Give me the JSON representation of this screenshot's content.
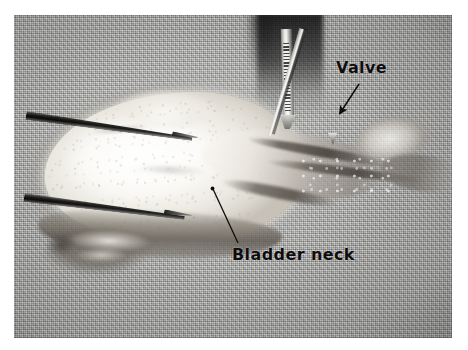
{
  "figure": {
    "kind": "surgical-specimen-photograph",
    "background_color": "#a8a8a6",
    "mount_color": "#ffffff"
  },
  "annotations": [
    {
      "id": "valve",
      "label": "Valve",
      "pointer": "arrow",
      "text_color": "#0d0d0d",
      "points_to": "valve structure at the distal bladder neck"
    },
    {
      "id": "bladder-neck",
      "label": "Bladder neck",
      "pointer": "leader-line",
      "text_color": "#0d0d0d",
      "points_to": "bladder neck region of the specimen"
    }
  ],
  "instruments": [
    {
      "id": "forceps-upper",
      "name": "forceps-upper-blade"
    },
    {
      "id": "forceps-lower",
      "name": "forceps-lower-blade"
    },
    {
      "id": "clamp",
      "name": "serrated-clamp"
    },
    {
      "id": "probe",
      "name": "pointed-probe"
    }
  ],
  "specimen": {
    "parts": [
      {
        "id": "bladder",
        "name": "bladder-mass"
      },
      {
        "id": "urethra",
        "name": "urethra-segment"
      },
      {
        "id": "distal-tissue",
        "name": "distal-tissue"
      }
    ]
  }
}
